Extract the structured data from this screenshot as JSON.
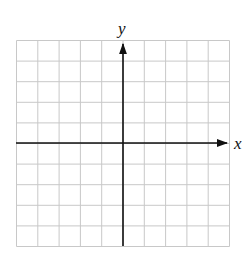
{
  "diagram": {
    "type": "coordinate-grid",
    "grid": {
      "columns": 10,
      "rows": 10,
      "line_color": "#c8c8c8"
    },
    "axes": {
      "x_label": "x",
      "y_label": "y",
      "color": "#111111",
      "x_axis_row": 5,
      "y_axis_column": 5
    }
  },
  "chart_data": {
    "type": "scatter",
    "title": "",
    "xlabel": "x",
    "ylabel": "y",
    "grid": true,
    "series": [],
    "xlim": [
      -5,
      5
    ],
    "ylim": [
      -5,
      5
    ]
  }
}
